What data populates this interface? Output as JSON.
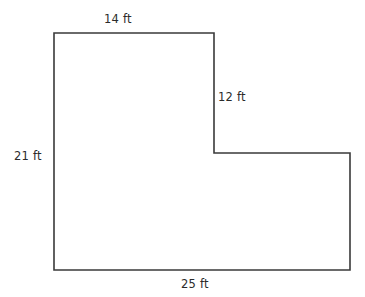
{
  "figure": {
    "background_color": "#ffffff",
    "stroke_color": "#3a3a3a",
    "fill": "none",
    "unit": "ft",
    "labels": {
      "top": "14 ft",
      "right": "12 ft",
      "left": "21 ft",
      "bottom": "25 ft"
    },
    "chart_data": {
      "type": "diagram",
      "shape": "L-shaped hexagon",
      "vertices": [
        [
          54,
          33
        ],
        [
          214,
          33
        ],
        [
          214,
          153
        ],
        [
          350,
          153
        ],
        [
          350,
          270
        ],
        [
          54,
          270
        ]
      ],
      "sides": [
        {
          "name": "top",
          "label": "14 ft",
          "value": 14,
          "unit": "ft",
          "orientation": "horizontal"
        },
        {
          "name": "upper-right-vertical",
          "label": "12 ft",
          "value": 12,
          "unit": "ft",
          "orientation": "vertical"
        },
        {
          "name": "inner-horizontal",
          "label": "",
          "value": null,
          "unit": "ft",
          "orientation": "horizontal"
        },
        {
          "name": "right",
          "label": "",
          "value": null,
          "unit": "ft",
          "orientation": "vertical"
        },
        {
          "name": "bottom",
          "label": "25 ft",
          "value": 25,
          "unit": "ft",
          "orientation": "horizontal"
        },
        {
          "name": "left",
          "label": "21 ft",
          "value": 21,
          "unit": "ft",
          "orientation": "vertical"
        }
      ],
      "labeled_values": [
        14,
        12,
        21,
        25
      ],
      "title": "",
      "grid": false,
      "legend": false
    }
  }
}
